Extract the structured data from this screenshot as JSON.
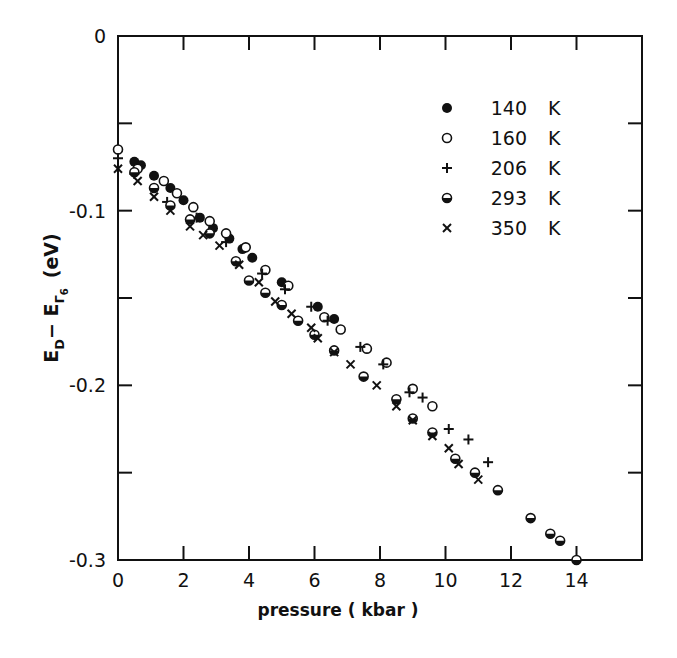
{
  "chart_data": {
    "type": "scatter",
    "title": "",
    "xlabel": "pressure ( kbar )",
    "ylabel": "E_D - E_Γ6 (eV)",
    "ylabel_parts": {
      "main": "E",
      "sub1": "D",
      "minus": "− E",
      "sub2": "Γ",
      "sub3": "6",
      "unit": "(eV)"
    },
    "xlim": [
      0,
      16
    ],
    "ylim": [
      -0.3,
      0
    ],
    "x_ticks": [
      0,
      2,
      4,
      6,
      8,
      10,
      12,
      14,
      16
    ],
    "x_tick_labels": [
      "0",
      "2",
      "4",
      "6",
      "8",
      "10",
      "12",
      "14"
    ],
    "y_ticks": [
      0,
      -0.05,
      -0.1,
      -0.15,
      -0.2,
      -0.25,
      -0.3
    ],
    "y_tick_labels": [
      {
        "value": 0,
        "label": "0"
      },
      {
        "value": -0.1,
        "label": "-0.1"
      },
      {
        "value": -0.2,
        "label": "-0.2"
      },
      {
        "value": -0.3,
        "label": "-0.3"
      }
    ],
    "grid": false,
    "legend_position": "upper right (inside plot)",
    "series": [
      {
        "name": "140 K",
        "marker": "filled-circle",
        "x": [
          0.5,
          0.7,
          1.1,
          1.6,
          2.0,
          2.5,
          2.9,
          3.4,
          3.8,
          4.1,
          5.0,
          6.1,
          6.6
        ],
        "y": [
          -0.072,
          -0.074,
          -0.08,
          -0.087,
          -0.094,
          -0.104,
          -0.11,
          -0.116,
          -0.122,
          -0.127,
          -0.141,
          -0.155,
          -0.162
        ]
      },
      {
        "name": "160 K",
        "marker": "open-circle",
        "x": [
          0.0,
          0.6,
          1.4,
          1.8,
          2.3,
          2.8,
          3.3,
          3.9,
          4.5,
          5.2,
          6.3,
          6.8,
          7.6,
          8.2,
          9.0,
          9.6
        ],
        "y": [
          -0.065,
          -0.076,
          -0.083,
          -0.09,
          -0.098,
          -0.106,
          -0.113,
          -0.121,
          -0.134,
          -0.143,
          -0.161,
          -0.168,
          -0.179,
          -0.187,
          -0.202,
          -0.212
        ]
      },
      {
        "name": "206 K",
        "marker": "plus",
        "x": [
          0.0,
          0.5,
          1.5,
          2.4,
          3.3,
          4.4,
          5.1,
          5.9,
          6.4,
          7.4,
          8.1,
          8.9,
          9.3,
          10.1,
          10.7,
          11.3
        ],
        "y": [
          -0.07,
          -0.079,
          -0.095,
          -0.104,
          -0.118,
          -0.136,
          -0.145,
          -0.155,
          -0.163,
          -0.178,
          -0.188,
          -0.204,
          -0.207,
          -0.225,
          -0.231,
          -0.244
        ]
      },
      {
        "name": "293 K",
        "marker": "half-filled-circle",
        "x": [
          0.5,
          1.1,
          1.6,
          2.2,
          2.8,
          3.6,
          4.0,
          4.5,
          5.0,
          5.5,
          6.0,
          6.6,
          7.5,
          8.5,
          9.0,
          9.6,
          10.3,
          10.9,
          11.6,
          12.6,
          13.2,
          13.5,
          14.0
        ],
        "y": [
          -0.078,
          -0.087,
          -0.097,
          -0.105,
          -0.113,
          -0.129,
          -0.14,
          -0.147,
          -0.154,
          -0.163,
          -0.171,
          -0.18,
          -0.195,
          -0.208,
          -0.219,
          -0.227,
          -0.242,
          -0.25,
          -0.26,
          -0.276,
          -0.285,
          -0.289,
          -0.3
        ]
      },
      {
        "name": "350 K",
        "marker": "cross",
        "x": [
          0.0,
          0.6,
          1.1,
          1.6,
          2.2,
          2.6,
          3.1,
          3.7,
          4.3,
          4.8,
          5.3,
          5.9,
          6.1,
          6.6,
          7.1,
          7.9,
          8.5,
          9.0,
          9.6,
          10.1,
          10.4,
          11.0
        ],
        "y": [
          -0.076,
          -0.083,
          -0.092,
          -0.1,
          -0.109,
          -0.114,
          -0.12,
          -0.131,
          -0.141,
          -0.152,
          -0.159,
          -0.167,
          -0.173,
          -0.181,
          -0.188,
          -0.2,
          -0.212,
          -0.22,
          -0.229,
          -0.236,
          -0.245,
          -0.254
        ]
      }
    ],
    "legend": [
      {
        "label": "140 K",
        "marker": "filled-circle"
      },
      {
        "label": "160 K",
        "marker": "open-circle"
      },
      {
        "label": "206 K",
        "marker": "plus"
      },
      {
        "label": "293 K",
        "marker": "half-filled-circle"
      },
      {
        "label": "350 K",
        "marker": "cross"
      }
    ]
  },
  "style": {
    "ink": "#111111",
    "background": "#ffffff"
  }
}
